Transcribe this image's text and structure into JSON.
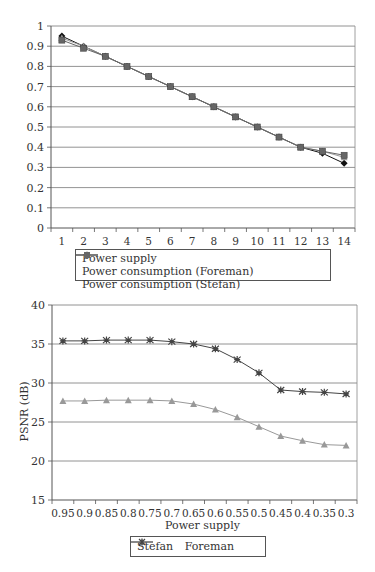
{
  "chart_data": [
    {
      "type": "line",
      "title": "",
      "xlabel": "",
      "ylabel": "",
      "categories": [
        "1",
        "2",
        "3",
        "4",
        "5",
        "6",
        "7",
        "8",
        "9",
        "10",
        "11",
        "12",
        "13",
        "14"
      ],
      "ylim": [
        0,
        1
      ],
      "yticks": [
        "0",
        "0.1",
        "0.2",
        "0.3",
        "0.4",
        "0.5",
        "0.6",
        "0.7",
        "0.8",
        "0.9",
        "1"
      ],
      "grid": true,
      "legend_position": "bottom",
      "series": [
        {
          "name": "Power supply",
          "marker": "diamond",
          "color": "#111111",
          "values": [
            0.95,
            0.9,
            0.85,
            0.8,
            0.75,
            0.7,
            0.65,
            0.6,
            0.55,
            0.5,
            0.45,
            0.4,
            0.37,
            0.32
          ]
        },
        {
          "name": "Power consumption (Foreman)",
          "marker": "triangle",
          "color": "#999999",
          "values": [
            0.94,
            0.9,
            0.85,
            0.8,
            0.75,
            0.7,
            0.65,
            0.6,
            0.55,
            0.5,
            0.45,
            0.4,
            0.38,
            0.35
          ]
        },
        {
          "name": "Power consumption (Stefan)",
          "marker": "square",
          "color": "#666666",
          "values": [
            0.93,
            0.89,
            0.85,
            0.8,
            0.75,
            0.7,
            0.65,
            0.6,
            0.55,
            0.5,
            0.45,
            0.4,
            0.38,
            0.36
          ]
        }
      ]
    },
    {
      "type": "line",
      "title": "",
      "xlabel": "Power supply",
      "ylabel": "PSNR (dB)",
      "categories": [
        "0.95",
        "0.9",
        "0.85",
        "0.8",
        "0.75",
        "0.7",
        "0.65",
        "0.6",
        "0.55",
        "0.5",
        "0.45",
        "0.4",
        "0.35",
        "0.3"
      ],
      "ylim": [
        15,
        40
      ],
      "yticks": [
        "15",
        "20",
        "25",
        "30",
        "35",
        "40"
      ],
      "grid": true,
      "legend_position": "bottom",
      "series": [
        {
          "name": "Stefan",
          "marker": "triangle",
          "color": "#999999",
          "values": [
            27.7,
            27.7,
            27.8,
            27.8,
            27.8,
            27.7,
            27.3,
            26.6,
            25.6,
            24.4,
            23.2,
            22.6,
            22.1,
            22.0
          ]
        },
        {
          "name": "Foreman",
          "marker": "star",
          "color": "#444444",
          "values": [
            35.4,
            35.4,
            35.5,
            35.5,
            35.5,
            35.3,
            35.0,
            34.4,
            33.0,
            31.3,
            29.1,
            28.9,
            28.8,
            28.6
          ]
        }
      ]
    }
  ],
  "chart1": {
    "legend": [
      "Power supply",
      "Power consumption (Foreman)",
      "Power consumption (Stefan)"
    ]
  },
  "chart2": {
    "xlabel": "Power supply",
    "ylabel": "PSNR (dB)",
    "legend": [
      "Stefan",
      "Foreman"
    ]
  }
}
